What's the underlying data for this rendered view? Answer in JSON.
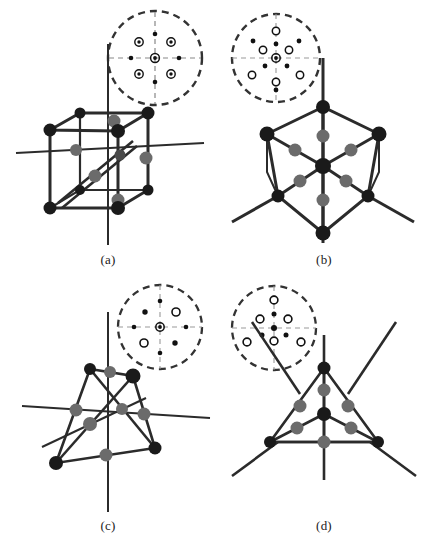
{
  "figure": {
    "background_color": "#ffffff",
    "width": 432,
    "height": 553
  },
  "colors": {
    "line": "#2b2b2b",
    "vertex_dark": "#1a1a1a",
    "atom_gray": "#6b6b6b",
    "dashed": "#555555",
    "spot_filled": "#111111",
    "spot_open_stroke": "#111111",
    "spot_open_fill": "#ffffff",
    "axis_dashed": "#777777"
  },
  "panels": [
    {
      "id": "a",
      "caption": "(a)",
      "model": {
        "name": "cube-model",
        "shape": "cube",
        "orientation": "[100] / four-fold axis",
        "vertex_atoms": 8,
        "gray_atoms": 6,
        "has_body_diagonal_arrow": true
      },
      "diffraction": {
        "name": "diffraction-pattern-a",
        "symmetry": "4-fold square",
        "center_spot": "ringed",
        "spots": [
          {
            "x": 0,
            "y": 0,
            "type": "ringed",
            "r": 4.2
          },
          {
            "x": -16,
            "y": -16,
            "type": "ringed",
            "r": 4.0
          },
          {
            "x": 16,
            "y": -16,
            "type": "ringed",
            "r": 4.0
          },
          {
            "x": -16,
            "y": 16,
            "type": "ringed",
            "r": 4.0
          },
          {
            "x": 16,
            "y": 16,
            "type": "ringed",
            "r": 4.0
          },
          {
            "x": 0,
            "y": -24,
            "type": "filled",
            "r": 2.2
          },
          {
            "x": 0,
            "y": 24,
            "type": "filled",
            "r": 2.2
          },
          {
            "x": -24,
            "y": 0,
            "type": "filled",
            "r": 2.2
          },
          {
            "x": 24,
            "y": 0,
            "type": "filled",
            "r": 2.2
          }
        ]
      }
    },
    {
      "id": "b",
      "caption": "(b)",
      "model": {
        "name": "cube-model-111",
        "shape": "cube",
        "orientation": "[111] / three-fold axis (hexagonal outline)",
        "vertex_atoms": 8,
        "gray_atoms": 6,
        "has_body_diagonal_arrow": false
      },
      "diffraction": {
        "name": "diffraction-pattern-b",
        "symmetry": "6-fold pseudo-hexagonal",
        "center_spot": "ringed",
        "spots": [
          {
            "x": 0,
            "y": 0,
            "type": "ringed",
            "r": 4.0
          },
          {
            "x": 0,
            "y": -27,
            "type": "open",
            "r": 3.6
          },
          {
            "x": 0,
            "y": 24,
            "type": "open",
            "r": 3.6
          },
          {
            "x": -13,
            "y": -8,
            "type": "open",
            "r": 3.6
          },
          {
            "x": 13,
            "y": -8,
            "type": "open",
            "r": 3.6
          },
          {
            "x": -24,
            "y": 17,
            "type": "open",
            "r": 3.6
          },
          {
            "x": 24,
            "y": 17,
            "type": "open",
            "r": 3.6
          },
          {
            "x": 0,
            "y": -14,
            "type": "filled",
            "r": 2.3
          },
          {
            "x": -11,
            "y": 8,
            "type": "filled",
            "r": 2.3
          },
          {
            "x": 11,
            "y": 8,
            "type": "filled",
            "r": 2.3
          },
          {
            "x": -23,
            "y": -17,
            "type": "filled",
            "r": 2.3
          },
          {
            "x": 23,
            "y": -17,
            "type": "filled",
            "r": 2.3
          },
          {
            "x": 0,
            "y": 32,
            "type": "filled",
            "r": 2.3
          }
        ]
      }
    },
    {
      "id": "c",
      "caption": "(c)",
      "model": {
        "name": "tetrahedron-model",
        "shape": "tetrahedron",
        "orientation": "general / tilted",
        "vertex_atoms": 4,
        "gray_atoms": 6,
        "has_body_diagonal_arrow": false
      },
      "diffraction": {
        "name": "diffraction-pattern-c",
        "symmetry": "2-fold, mixed filled and open spots",
        "center_spot": "ringed",
        "spots": [
          {
            "x": 0,
            "y": 0,
            "type": "ringed",
            "r": 4.0
          },
          {
            "x": -15,
            "y": -15,
            "type": "filled",
            "r": 2.6
          },
          {
            "x": 16,
            "y": -15,
            "type": "open",
            "r": 4.0
          },
          {
            "x": -16,
            "y": 15,
            "type": "open",
            "r": 4.0
          },
          {
            "x": 15,
            "y": 16,
            "type": "filled",
            "r": 2.6
          },
          {
            "x": 0,
            "y": -26,
            "type": "filled",
            "r": 2.2
          },
          {
            "x": 0,
            "y": 26,
            "type": "filled",
            "r": 2.2
          },
          {
            "x": -26,
            "y": 0,
            "type": "filled",
            "r": 2.2
          },
          {
            "x": 26,
            "y": 0,
            "type": "filled",
            "r": 2.2
          }
        ]
      }
    },
    {
      "id": "d",
      "caption": "(d)",
      "model": {
        "name": "tetrahedron-model-111",
        "shape": "tetrahedron",
        "orientation": "[111] / three-fold axis (triangular outline)",
        "vertex_atoms": 4,
        "gray_atoms": 6,
        "has_body_diagonal_arrow": false
      },
      "diffraction": {
        "name": "diffraction-pattern-d",
        "symmetry": "3-fold / hexagonal",
        "center_spot": "filled",
        "spots": [
          {
            "x": 0,
            "y": 0,
            "type": "filled",
            "r": 3.0
          },
          {
            "x": 0,
            "y": -28,
            "type": "open",
            "r": 3.8
          },
          {
            "x": 0,
            "y": 13,
            "type": "open",
            "r": 3.8
          },
          {
            "x": -14,
            "y": -9,
            "type": "open",
            "r": 3.8
          },
          {
            "x": 14,
            "y": -9,
            "type": "open",
            "r": 3.8
          },
          {
            "x": -27,
            "y": 14,
            "type": "open",
            "r": 3.8
          },
          {
            "x": 27,
            "y": 14,
            "type": "open",
            "r": 3.8
          },
          {
            "x": 0,
            "y": -14,
            "type": "filled",
            "r": 2.4
          },
          {
            "x": -12,
            "y": 7,
            "type": "filled",
            "r": 2.4
          },
          {
            "x": 12,
            "y": 7,
            "type": "filled",
            "r": 2.4
          }
        ]
      }
    }
  ]
}
